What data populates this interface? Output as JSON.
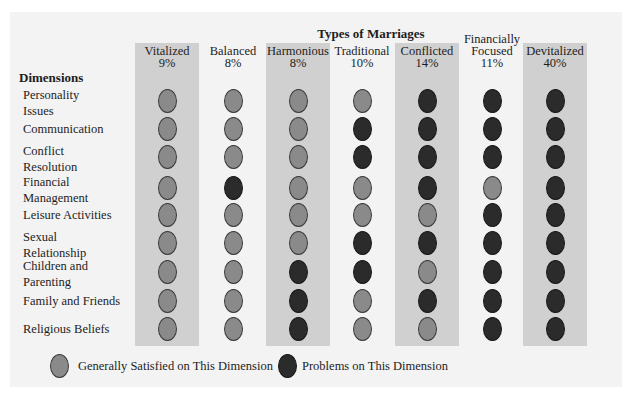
{
  "title": "Types of Marriages",
  "dimensions_header": "Dimensions",
  "colors": {
    "satisfied": "#8a8a8a",
    "problems": "#2b2b2b",
    "band": "#d0d0d0",
    "panel": "#f3f3f3"
  },
  "columns": [
    {
      "name": "Vitalized",
      "name_line1": "",
      "name_line2": "Vitalized",
      "percent": "9%",
      "shaded": true,
      "values": [
        "S",
        "S",
        "S",
        "S",
        "S",
        "S",
        "S",
        "S",
        "S"
      ]
    },
    {
      "name": "Balanced",
      "name_line1": "",
      "name_line2": "Balanced",
      "percent": "8%",
      "shaded": false,
      "values": [
        "S",
        "S",
        "S",
        "P",
        "S",
        "S",
        "S",
        "S",
        "S"
      ]
    },
    {
      "name": "Harmonious",
      "name_line1": "",
      "name_line2": "Harmonious",
      "percent": "8%",
      "shaded": true,
      "values": [
        "S",
        "S",
        "S",
        "S",
        "S",
        "S",
        "P",
        "P",
        "P"
      ]
    },
    {
      "name": "Traditional",
      "name_line1": "",
      "name_line2": "Traditional",
      "percent": "10%",
      "shaded": false,
      "values": [
        "S",
        "P",
        "P",
        "S",
        "S",
        "P",
        "P",
        "S",
        "S"
      ]
    },
    {
      "name": "Conflicted",
      "name_line1": "",
      "name_line2": "Conflicted",
      "percent": "14%",
      "shaded": true,
      "values": [
        "P",
        "P",
        "P",
        "P",
        "S",
        "P",
        "S",
        "P",
        "S"
      ]
    },
    {
      "name": "Financially Focused",
      "name_line1": "Financially",
      "name_line2": "Focused",
      "percent": "11%",
      "shaded": false,
      "values": [
        "P",
        "P",
        "P",
        "S",
        "P",
        "P",
        "P",
        "P",
        "P"
      ]
    },
    {
      "name": "Devitalized",
      "name_line1": "",
      "name_line2": "Devitalized",
      "percent": "40%",
      "shaded": true,
      "values": [
        "P",
        "P",
        "P",
        "P",
        "P",
        "P",
        "P",
        "P",
        "P"
      ]
    }
  ],
  "rows": [
    {
      "line1": "Personality",
      "line2": "Issues"
    },
    {
      "line1": "Communication",
      "line2": ""
    },
    {
      "line1": "Conflict",
      "line2": "Resolution"
    },
    {
      "line1": "Financial",
      "line2": "Management"
    },
    {
      "line1": "Leisure Activities",
      "line2": ""
    },
    {
      "line1": "Sexual",
      "line2": "Relationship"
    },
    {
      "line1": "Children and",
      "line2": "Parenting"
    },
    {
      "line1": "Family and Friends",
      "line2": ""
    },
    {
      "line1": "Religious Beliefs",
      "line2": ""
    }
  ],
  "legend": {
    "satisfied_label": "Generally Satisfied on This Dimension",
    "problems_label": "Problems on This Dimension"
  }
}
